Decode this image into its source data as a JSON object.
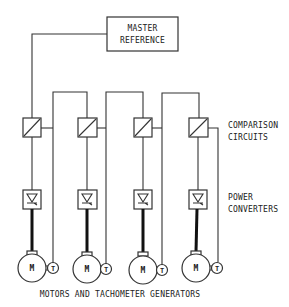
{
  "master_reference": {
    "line1": "MASTER",
    "line2": "REFERENCE"
  },
  "labels": {
    "comparison_line1": "COMPARISON",
    "comparison_line2": "CIRCUITS",
    "power_line1": "POWER",
    "power_line2": "CONVERTERS",
    "bottom_caption": "MOTORS AND TACHOMETER GENERATORS"
  },
  "channels": [
    {
      "motor_label": "M",
      "tacho_label": "T"
    },
    {
      "motor_label": "M",
      "tacho_label": "T"
    },
    {
      "motor_label": "M",
      "tacho_label": "T"
    },
    {
      "motor_label": "M",
      "tacho_label": "T"
    }
  ]
}
